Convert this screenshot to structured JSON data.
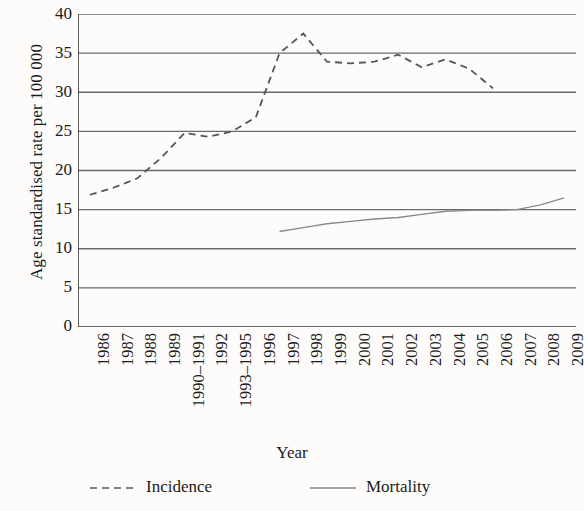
{
  "chart_data": {
    "type": "line",
    "title": "",
    "xlabel": "Year",
    "ylabel": "Age standardised rate per 100 000",
    "ylim": [
      0,
      40
    ],
    "yticks": [
      0,
      5,
      10,
      15,
      20,
      25,
      30,
      35,
      40
    ],
    "grid": "horizontal",
    "legend_position": "bottom",
    "categories": [
      "1986",
      "1987",
      "1988",
      "1989",
      "1990–1991",
      "1992",
      "1993–1995",
      "1996",
      "1997",
      "1998",
      "1999",
      "2000",
      "2001",
      "2002",
      "2003",
      "2004",
      "2005",
      "2006",
      "2007",
      "2008",
      "2009"
    ],
    "series": [
      {
        "name": "Incidence",
        "style": "dashed",
        "color": "#555555",
        "values": [
          16.9,
          17.8,
          19.0,
          21.6,
          24.8,
          24.3,
          25.0,
          26.8,
          35.0,
          37.5,
          33.9,
          33.7,
          33.9,
          34.8,
          33.2,
          34.2,
          33.0,
          30.5,
          null,
          null,
          null
        ]
      },
      {
        "name": "Mortality",
        "style": "solid",
        "color": "#8a8a8a",
        "values": [
          null,
          null,
          null,
          null,
          null,
          null,
          null,
          null,
          12.2,
          12.7,
          13.2,
          13.5,
          13.8,
          14.0,
          14.4,
          14.8,
          14.9,
          14.9,
          15.0,
          15.6,
          16.5
        ]
      }
    ]
  },
  "legend": {
    "incidence_label": "Incidence",
    "mortality_label": "Mortality"
  },
  "axes": {
    "y_title": "Age standardised rate per 100 000",
    "x_title": "Year",
    "y_tick_0": "0",
    "y_tick_1": "5",
    "y_tick_2": "10",
    "y_tick_3": "15",
    "y_tick_4": "20",
    "y_tick_5": "25",
    "y_tick_6": "30",
    "y_tick_7": "35",
    "y_tick_8": "40"
  },
  "colors": {
    "background": "#fdfcfa",
    "gridline": "#6a6a6a",
    "axis": "#3a3a3a",
    "incidence": "#555555",
    "mortality": "#8a8a8a",
    "text": "#1b1b1b"
  }
}
